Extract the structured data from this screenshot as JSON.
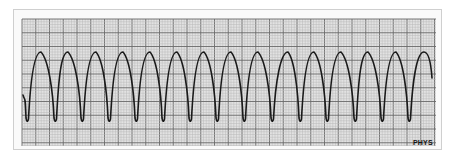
{
  "strip": {
    "label": "PHYS",
    "grid": {
      "x0": 22,
      "y0": 19,
      "x1": 436,
      "y1": 146,
      "minor_step": 2.75,
      "major_every": 5,
      "minor_color": "#b9b9b9",
      "major_color": "#6a6a6a",
      "background": "#e2e2e2"
    },
    "waveform": {
      "color": "#1a1a1a",
      "peak_y": 52,
      "trough_y": 122,
      "peaks_x": [
        41,
        68,
        96,
        123,
        150,
        177,
        204,
        231,
        258,
        288,
        314,
        341,
        368,
        396,
        424
      ],
      "troughs_x": [
        27,
        55,
        82,
        109,
        136,
        163,
        190,
        217,
        244,
        272,
        300,
        327,
        355,
        382,
        409
      ],
      "start": [
        23,
        95
      ],
      "end": [
        432,
        78
      ]
    }
  }
}
